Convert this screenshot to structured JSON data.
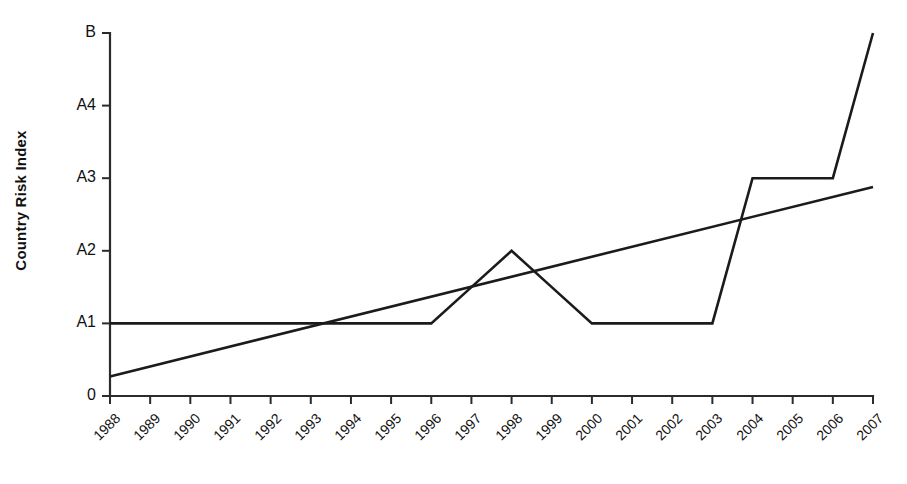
{
  "chart_data": {
    "type": "line",
    "title": "",
    "xlabel": "",
    "ylabel": "Country Risk Index",
    "x": [
      1988,
      1989,
      1990,
      1991,
      1992,
      1993,
      1994,
      1995,
      1996,
      1997,
      1998,
      1999,
      2000,
      2001,
      2002,
      2003,
      2004,
      2005,
      2006,
      2007
    ],
    "xtick_labels": [
      "1988",
      "1989",
      "1990",
      "1991",
      "1992",
      "1993",
      "1994",
      "1995",
      "1996",
      "1997",
      "1998",
      "1999",
      "2000",
      "2001",
      "2002",
      "2003",
      "2004",
      "2005",
      "2006",
      "2007"
    ],
    "ytick_labels": [
      "0",
      "A1",
      "A2",
      "A3",
      "A4",
      "B"
    ],
    "ytick_values": [
      0,
      1,
      2,
      3,
      4,
      5
    ],
    "ylim": [
      0,
      5
    ],
    "xlim": [
      1988,
      2007
    ],
    "grid": false,
    "legend": false,
    "legend_position": "none",
    "series": [
      {
        "name": "Country Risk Index",
        "type": "line",
        "color": "#1b1b1b",
        "values": [
          1,
          1,
          1,
          1,
          1,
          1,
          1,
          1,
          1,
          1.5,
          2,
          1.5,
          1,
          1,
          1,
          1,
          3,
          3,
          3,
          5
        ]
      },
      {
        "name": "Linear trend",
        "type": "line",
        "color": "#1b1b1b",
        "x": [
          1988,
          2007
        ],
        "values": [
          0.27,
          2.88
        ]
      }
    ],
    "annotations": []
  },
  "axes": {
    "y_axis_title": "Country Risk Index"
  }
}
